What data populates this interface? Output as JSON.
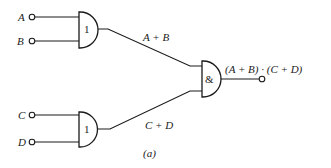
{
  "diagram": {
    "type": "logic-circuit",
    "caption": "(a)",
    "inputs": [
      {
        "id": "A",
        "label": "A"
      },
      {
        "id": "B",
        "label": "B"
      },
      {
        "id": "C",
        "label": "C"
      },
      {
        "id": "D",
        "label": "D"
      }
    ],
    "gates": [
      {
        "id": "or1",
        "symbol": "1",
        "kind": "OR",
        "inputs": [
          "A",
          "B"
        ],
        "output_label": "A + B"
      },
      {
        "id": "or2",
        "symbol": "1",
        "kind": "OR",
        "inputs": [
          "C",
          "D"
        ],
        "output_label": "C + D"
      },
      {
        "id": "and1",
        "symbol": "&",
        "kind": "AND",
        "inputs": [
          "or1",
          "or2"
        ],
        "output_label": "(A + B) · (C + D)"
      }
    ],
    "output": {
      "label": "(A + B) · (C + D)"
    }
  }
}
